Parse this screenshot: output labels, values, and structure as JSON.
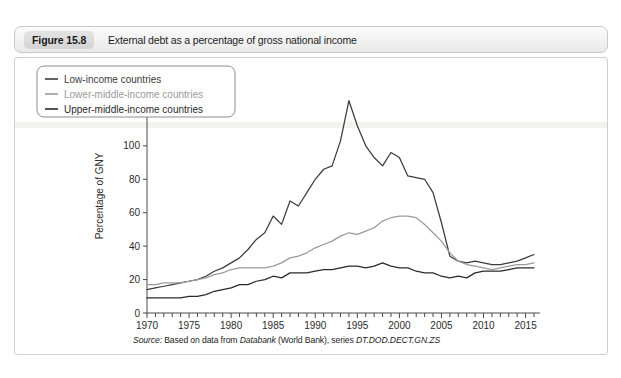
{
  "figure": {
    "label": "Figure 15.8",
    "caption": "External debt as a percentage of gross national income"
  },
  "source": {
    "lead": "Source:",
    "text_before": " Based on data from ",
    "italic_1": "Databank",
    "text_mid": " (World Bank), series ",
    "italic_2": "DT.DOD.DECT.GN.ZS"
  },
  "colors": {
    "low_income": "#3c3c3c",
    "lower_middle_income": "#9a9a9a",
    "upper_middle_income": "#2a2a2a",
    "axis": "#4a4a4a",
    "panel_border": "#d0d0d0",
    "header_border": "#c9c9c9"
  },
  "chart_data": {
    "type": "line",
    "title": "External debt as a percentage of gross national income",
    "xlabel": "",
    "ylabel": "Percentage of GNY",
    "xlim": [
      1970,
      2016
    ],
    "ylim": [
      0,
      140
    ],
    "ytick_step": 20,
    "yticks": [
      0,
      20,
      40,
      60,
      80,
      100,
      120,
      140
    ],
    "xticks_labeled": [
      1970,
      1975,
      1980,
      1985,
      1990,
      1995,
      2000,
      2005,
      2010,
      2015
    ],
    "xtick_minor_step": 1,
    "grid": false,
    "legend_position": "top-left",
    "x": [
      1970,
      1971,
      1972,
      1973,
      1974,
      1975,
      1976,
      1977,
      1978,
      1979,
      1980,
      1981,
      1982,
      1983,
      1984,
      1985,
      1986,
      1987,
      1988,
      1989,
      1990,
      1991,
      1992,
      1993,
      1994,
      1995,
      1996,
      1997,
      1998,
      1999,
      2000,
      2001,
      2002,
      2003,
      2004,
      2005,
      2006,
      2007,
      2008,
      2009,
      2010,
      2011,
      2012,
      2013,
      2014,
      2015,
      2016
    ],
    "series": [
      {
        "name": "Low-income countries",
        "color": "#3c3c3c",
        "values": [
          14,
          15,
          16,
          17,
          18,
          19,
          20,
          22,
          25,
          27,
          30,
          33,
          38,
          44,
          48,
          58,
          53,
          67,
          64,
          72,
          80,
          86,
          88,
          103,
          127,
          112,
          100,
          93,
          88,
          96,
          93,
          82,
          81,
          80,
          72,
          54,
          34,
          31,
          30,
          31,
          30,
          29,
          29,
          30,
          31,
          33,
          35
        ]
      },
      {
        "name": "Lower-middle-income countries",
        "color": "#9a9a9a",
        "values": [
          17,
          17,
          18,
          18,
          18,
          19,
          20,
          21,
          23,
          24,
          26,
          27,
          27,
          27,
          27,
          28,
          30,
          33,
          34,
          36,
          39,
          41,
          43,
          46,
          48,
          47,
          49,
          51,
          55,
          57,
          58,
          58,
          57,
          53,
          48,
          43,
          36,
          31,
          29,
          28,
          27,
          26,
          27,
          28,
          29,
          29,
          30
        ]
      },
      {
        "name": "Upper-middle-income countries",
        "color": "#2a2a2a",
        "values": [
          9,
          9,
          9,
          9,
          9,
          10,
          10,
          11,
          13,
          14,
          15,
          17,
          17,
          19,
          20,
          22,
          21,
          24,
          24,
          24,
          25,
          26,
          26,
          27,
          28,
          28,
          27,
          28,
          30,
          28,
          27,
          27,
          25,
          24,
          24,
          22,
          21,
          22,
          21,
          24,
          25,
          25,
          25,
          26,
          27,
          27,
          27
        ]
      }
    ]
  }
}
